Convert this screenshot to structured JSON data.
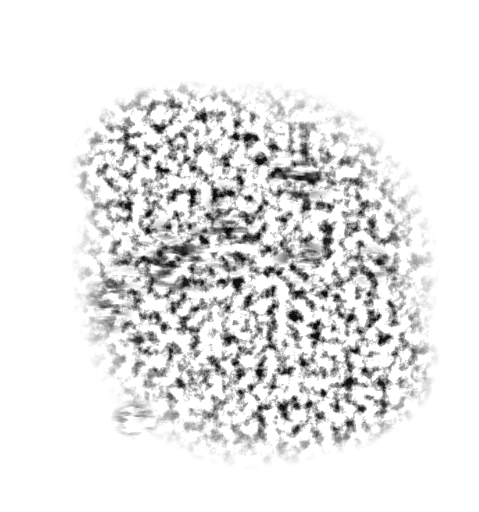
{
  "image": {
    "description": "Grunge distressed black ink brush texture on white background",
    "background_color": "#ffffff",
    "ink_color": "#111111",
    "shape": "irregular roughly square blotch with speckled edges"
  }
}
